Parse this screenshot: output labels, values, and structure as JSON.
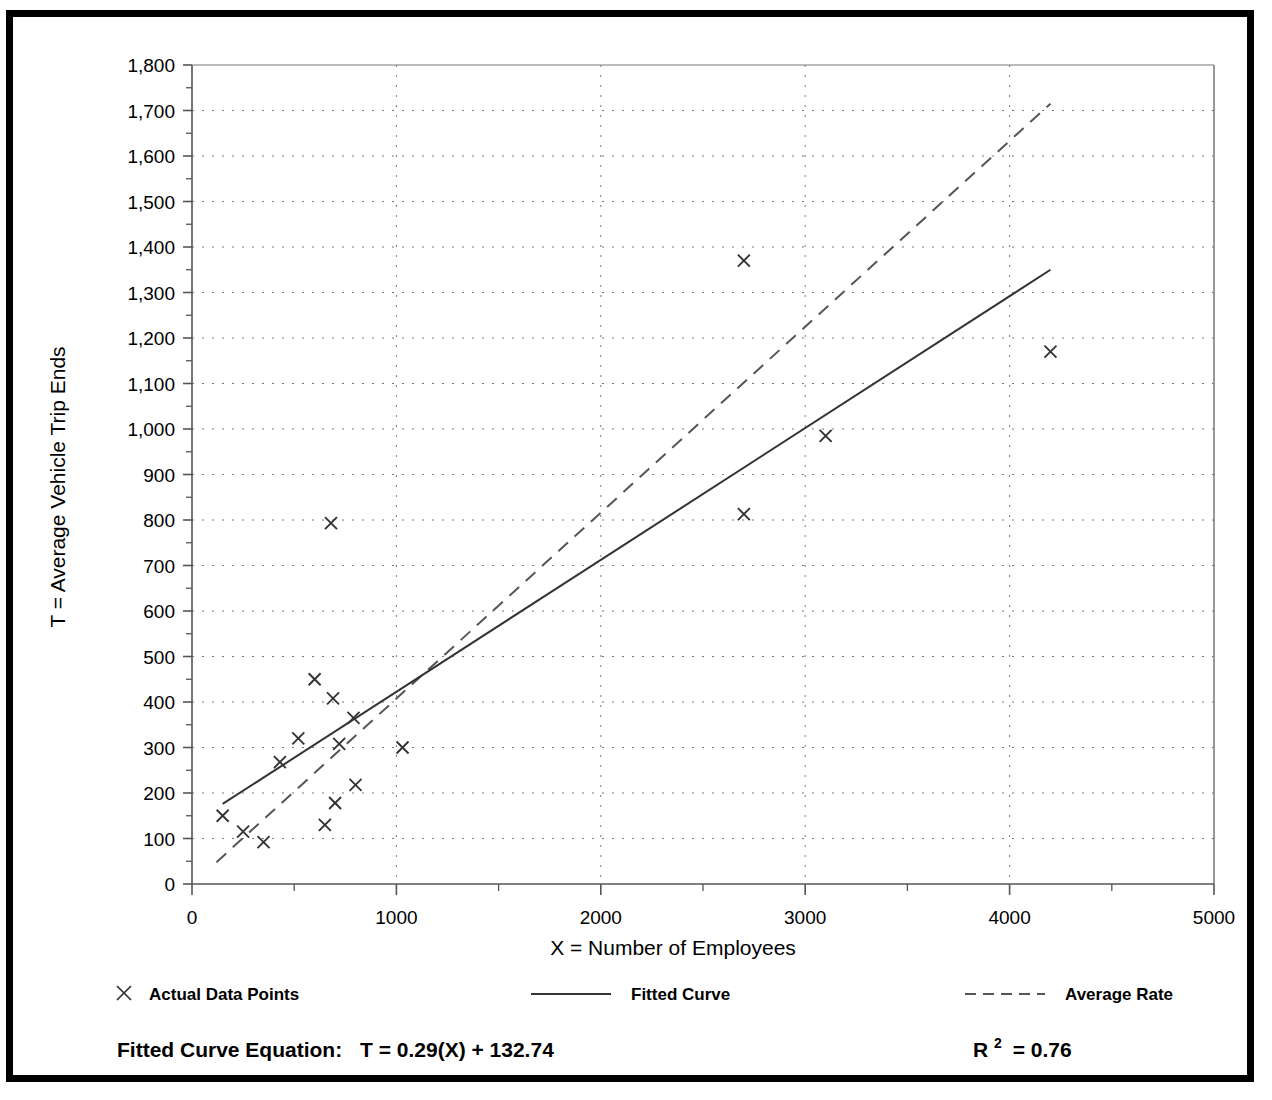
{
  "chart_data": {
    "type": "scatter",
    "title": "",
    "xlabel": "X = Number of Employees",
    "ylabel": "T = Average Vehicle Trip Ends",
    "xlim": [
      0,
      5000
    ],
    "ylim": [
      0,
      1800
    ],
    "x_ticks": [
      "0",
      "1000",
      "2000",
      "3000",
      "4000",
      "5000"
    ],
    "x_tick_values": [
      0,
      1000,
      2000,
      3000,
      4000,
      5000
    ],
    "x_minor_step": 500,
    "y_ticks": [
      "0",
      "100",
      "200",
      "300",
      "400",
      "500",
      "600",
      "700",
      "800",
      "900",
      "1,000",
      "1,100",
      "1,200",
      "1,300",
      "1,400",
      "1,500",
      "1,600",
      "1,700",
      "1,800"
    ],
    "y_tick_values": [
      0,
      100,
      200,
      300,
      400,
      500,
      600,
      700,
      800,
      900,
      1000,
      1100,
      1200,
      1300,
      1400,
      1500,
      1600,
      1700,
      1800
    ],
    "y_minor_step": 50,
    "grid": true,
    "grid_style": "dotted",
    "legend_position": "below-axes",
    "series": [
      {
        "name": "Actual Data Points",
        "type": "scatter",
        "marker": "x",
        "points": [
          [
            150,
            150
          ],
          [
            250,
            115
          ],
          [
            350,
            92
          ],
          [
            430,
            268
          ],
          [
            520,
            320
          ],
          [
            600,
            450
          ],
          [
            650,
            130
          ],
          [
            680,
            793
          ],
          [
            690,
            408
          ],
          [
            700,
            178
          ],
          [
            720,
            308
          ],
          [
            790,
            365
          ],
          [
            800,
            218
          ],
          [
            1030,
            300
          ],
          [
            2700,
            1370
          ],
          [
            2700,
            813
          ],
          [
            3100,
            985
          ],
          [
            4200,
            1170
          ]
        ]
      },
      {
        "name": "Fitted Curve",
        "type": "line",
        "style": "solid",
        "endpoints": [
          [
            150,
            176
          ],
          [
            4200,
            1350
          ]
        ],
        "equation": "T = 0.29(X) + 132.74",
        "slope": 0.29,
        "intercept": 132.74,
        "r_squared": 0.76
      },
      {
        "name": "Average Rate",
        "type": "line",
        "style": "dashed",
        "endpoints": [
          [
            120,
            48
          ],
          [
            4200,
            1715
          ]
        ]
      }
    ]
  },
  "legend": {
    "items": [
      {
        "label": "Actual Data Points",
        "symbol": "x-marker"
      },
      {
        "label": "Fitted Curve",
        "symbol": "solid-line"
      },
      {
        "label": "Average Rate",
        "symbol": "dashed-line"
      }
    ]
  },
  "footer": {
    "equation_label": "Fitted Curve Equation:",
    "equation_value": "T = 0.29(X) + 132.74",
    "r2_base": "R",
    "r2_exponent": "2",
    "r2_value": "= 0.76"
  },
  "colors": {
    "frame": "#000000",
    "axis": "#555555",
    "grid": "#777777",
    "marker": "#333333",
    "fitted_line": "#333333",
    "average_line": "#555555",
    "text": "#000000"
  }
}
